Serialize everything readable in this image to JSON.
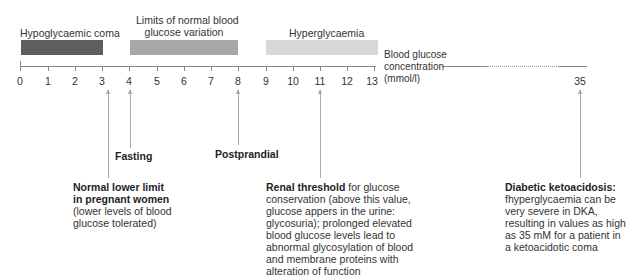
{
  "zones": [
    {
      "label": "Hypoglycaemic coma",
      "from": 0,
      "to": 3,
      "color": "#5e5e5e"
    },
    {
      "label_line1": "Limits of normal blood",
      "label_line2": "glucose variation",
      "from": 4,
      "to": 8,
      "color": "#a8a8a8"
    },
    {
      "label": "Hyperglycaemia",
      "from": 9,
      "to": 13,
      "color": "#d8d8d8"
    }
  ],
  "axis": {
    "ticks": [
      "0",
      "1",
      "2",
      "3",
      "4",
      "5",
      "6",
      "7",
      "8",
      "9",
      "10",
      "11",
      "12",
      "13"
    ],
    "far_tick": "35",
    "title_line1": "Blood glucose",
    "title_line2": "concentration",
    "title_line3": "(mmol/l)"
  },
  "annotations": {
    "fasting": {
      "value": 4,
      "title": "Fasting"
    },
    "postprandial": {
      "value": 8,
      "title": "Postprandial"
    },
    "pregnant": {
      "value": 3.2,
      "title_line1": "Normal lower limit",
      "title_line2": "in pregnant women",
      "body_line1": "(lower levels of blood",
      "body_line2": "glucose tolerated)"
    },
    "renal": {
      "value": 11,
      "title": "Renal threshold",
      "title_suffix": " for glucose",
      "lines": [
        "conservation (above this value,",
        "glucose appers in the urine:",
        "glycosuria); prolonged elevated",
        "blood glucose levels lead to",
        "abnormal glycosylation of blood",
        "and membrane proteins with",
        "alteration of function"
      ]
    },
    "dka": {
      "value": 35,
      "title": "Diabetic ketoacidosis:",
      "lines": [
        "fhyperglycaemia can be",
        "very severe in DKA,",
        "resulting in values as high",
        "as 35 mM for a patient in",
        "a ketoacidotic coma"
      ]
    }
  },
  "colors": {
    "axis": "#8a8a8a",
    "arrow": "#a8a8a8",
    "text": "#333333"
  }
}
